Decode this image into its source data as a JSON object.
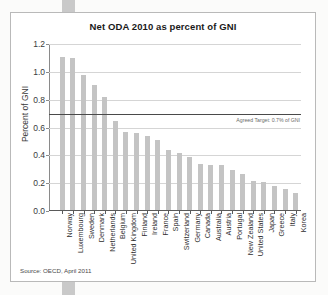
{
  "figure": {
    "source_note": "Source: OECD, April 2011"
  },
  "chart_data": {
    "type": "bar",
    "title": "Net ODA 2010 as percent of GNI",
    "xlabel": "",
    "ylabel": "Percent of GNI",
    "ylim": [
      0.0,
      1.2
    ],
    "yticks": [
      "0.0",
      "0.2",
      "0.4",
      "0.6",
      "0.8",
      "1.0",
      "1.2"
    ],
    "ytick_values": [
      0.0,
      0.2,
      0.4,
      0.6,
      0.8,
      1.0,
      1.2
    ],
    "grid": true,
    "legend": "none",
    "bar_color": "#c4c4c4",
    "annotation": {
      "label": "Agreed Target: 0.7% of GNI",
      "value": 0.7,
      "line_color": "#4a4a4a"
    },
    "categories": [
      "Norway",
      "Luxembourg",
      "Sweden",
      "Denmark",
      "Netherlands",
      "Belgium",
      "United Kingdom",
      "Finland",
      "Ireland",
      "France",
      "Spain",
      "Switzerland",
      "Germany",
      "Canada",
      "Australia",
      "Austria",
      "Portugal",
      "New Zealand",
      "United States",
      "Japan",
      "Greece",
      "Italy",
      "Korea"
    ],
    "values": [
      1.1,
      1.09,
      0.97,
      0.9,
      0.81,
      0.64,
      0.56,
      0.55,
      0.53,
      0.5,
      0.43,
      0.41,
      0.38,
      0.33,
      0.32,
      0.32,
      0.29,
      0.26,
      0.21,
      0.2,
      0.17,
      0.15,
      0.12
    ]
  }
}
